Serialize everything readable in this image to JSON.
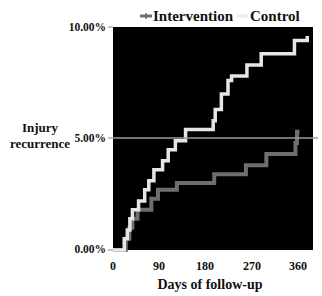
{
  "chart_data": {
    "type": "line",
    "subtype": "step",
    "title": "",
    "xlabel": "Days of follow-up",
    "ylabel": "Injury recurrence",
    "ylabel_lines": [
      "Injury",
      "recurrence"
    ],
    "xlim": [
      0,
      390
    ],
    "ylim": [
      0,
      10
    ],
    "xticks": [
      0,
      90,
      180,
      270,
      360
    ],
    "xtick_labels": [
      "0",
      "90",
      "180",
      "270",
      "360"
    ],
    "yticks": [
      0,
      5,
      10
    ],
    "ytick_labels": [
      "0.00%",
      "5.00%",
      "10.00%"
    ],
    "grid": false,
    "reference_line_y": 5,
    "background": "#000000",
    "legend": {
      "position": "top",
      "entries": [
        "Intervention",
        "Control"
      ]
    },
    "series": [
      {
        "name": "Intervention",
        "color": "#6e6e6e",
        "x": [
          0,
          25,
          32,
          38,
          48,
          75,
          88,
          125,
          198,
          260,
          300,
          357,
          360,
          365
        ],
        "y": [
          0,
          0.5,
          1.0,
          1.4,
          1.8,
          2.3,
          2.7,
          3.0,
          3.4,
          3.8,
          4.3,
          4.8,
          5.3,
          5.3
        ]
      },
      {
        "name": "Control",
        "color": "#e6e6e6",
        "x": [
          0,
          22,
          28,
          33,
          38,
          50,
          62,
          70,
          80,
          97,
          108,
          122,
          142,
          196,
          200,
          212,
          225,
          232,
          262,
          290,
          355,
          380
        ],
        "y": [
          0,
          0.5,
          0.9,
          1.4,
          1.8,
          2.2,
          2.7,
          3.1,
          3.6,
          4.0,
          4.5,
          4.9,
          5.4,
          5.8,
          6.3,
          7.0,
          7.6,
          7.8,
          8.3,
          8.8,
          9.4,
          9.6
        ]
      }
    ]
  },
  "legend": {
    "intervention_label": "Intervention",
    "control_label": "Control"
  },
  "axes": {
    "xlabel": "Days of follow-up",
    "ylabel_line1": "Injury",
    "ylabel_line2": "recurrence"
  }
}
